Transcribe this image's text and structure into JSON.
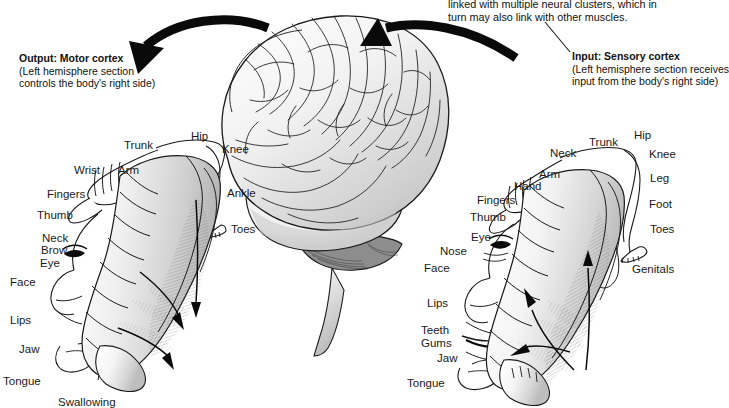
{
  "figure": {
    "background_color": "#ffffff",
    "ink_color": "#1a1a1a"
  },
  "top_note": {
    "name": "neural-cluster-note",
    "lines": [
      "linked with multiple neural clusters, which in",
      "turn may also link with other muscles."
    ]
  },
  "captions": {
    "output": {
      "heading": "Output: Motor cortex",
      "lines": [
        "(Left hemisphere section",
        "controls the body's right side)"
      ]
    },
    "input": {
      "heading": "Input: Sensory cortex",
      "lines": [
        "(Left hemisphere section receives",
        "input from the body's right side)"
      ]
    }
  },
  "brain": {
    "name": "brain-illustration",
    "description": "Lateral view of a human brain with cerebellum and brainstem"
  },
  "arrows": {
    "output_arrow": "curved-arrow-pointing-left",
    "input_arrow": "curved-arrow-pointing-left-into-brain",
    "input_leader": "leader-line"
  },
  "motor_homunculus": {
    "name": "motor-cortex-homunculus",
    "labels": [
      {
        "text": "Trunk",
        "x": 124,
        "y": 139,
        "align": "left"
      },
      {
        "text": "Hip",
        "x": 191,
        "y": 130,
        "align": "left"
      },
      {
        "text": "Knee",
        "x": 222,
        "y": 143,
        "align": "left"
      },
      {
        "text": "Wrist",
        "x": 74,
        "y": 164,
        "align": "left"
      },
      {
        "text": "Arm",
        "x": 118,
        "y": 164,
        "align": "left"
      },
      {
        "text": "Ankle",
        "x": 227,
        "y": 187,
        "align": "left"
      },
      {
        "text": "Fingers",
        "x": 47,
        "y": 188,
        "align": "left"
      },
      {
        "text": "Thumb",
        "x": 37,
        "y": 209,
        "align": "left"
      },
      {
        "text": "Toes",
        "x": 231,
        "y": 223,
        "align": "left"
      },
      {
        "text": "Neck",
        "x": 42,
        "y": 232,
        "align": "left"
      },
      {
        "text": "Brow",
        "x": 41,
        "y": 244,
        "align": "left"
      },
      {
        "text": "Eye",
        "x": 40,
        "y": 257,
        "align": "left"
      },
      {
        "text": "Face",
        "x": 10,
        "y": 276,
        "align": "left"
      },
      {
        "text": "Lips",
        "x": 10,
        "y": 314,
        "align": "left"
      },
      {
        "text": "Jaw",
        "x": 19,
        "y": 343,
        "align": "left"
      },
      {
        "text": "Tongue",
        "x": 3,
        "y": 375,
        "align": "left"
      },
      {
        "text": "Swallowing",
        "x": 58,
        "y": 396,
        "align": "left"
      }
    ]
  },
  "sensory_homunculus": {
    "name": "sensory-cortex-homunculus",
    "labels": [
      {
        "text": "Neck",
        "x": 550,
        "y": 147,
        "align": "left"
      },
      {
        "text": "Trunk",
        "x": 589,
        "y": 136,
        "align": "left"
      },
      {
        "text": "Hip",
        "x": 634,
        "y": 129,
        "align": "left"
      },
      {
        "text": "Knee",
        "x": 649,
        "y": 148,
        "align": "left"
      },
      {
        "text": "Arm",
        "x": 539,
        "y": 168,
        "align": "left"
      },
      {
        "text": "Leg",
        "x": 650,
        "y": 172,
        "align": "left"
      },
      {
        "text": "Hand",
        "x": 514,
        "y": 180,
        "align": "left"
      },
      {
        "text": "Fingers",
        "x": 477,
        "y": 194,
        "align": "left"
      },
      {
        "text": "Foot",
        "x": 649,
        "y": 198,
        "align": "left"
      },
      {
        "text": "Thumb",
        "x": 470,
        "y": 211,
        "align": "left"
      },
      {
        "text": "Toes",
        "x": 650,
        "y": 223,
        "align": "left"
      },
      {
        "text": "Eye",
        "x": 471,
        "y": 231,
        "align": "left"
      },
      {
        "text": "Nose",
        "x": 440,
        "y": 245,
        "align": "left"
      },
      {
        "text": "Face",
        "x": 424,
        "y": 262,
        "align": "left"
      },
      {
        "text": "Genitals",
        "x": 632,
        "y": 263,
        "align": "left"
      },
      {
        "text": "Lips",
        "x": 427,
        "y": 297,
        "align": "left"
      },
      {
        "text": "Teeth",
        "x": 421,
        "y": 324,
        "align": "left"
      },
      {
        "text": "Gums",
        "x": 421,
        "y": 337,
        "align": "left"
      },
      {
        "text": "Jaw",
        "x": 437,
        "y": 352,
        "align": "left"
      },
      {
        "text": "Tongue",
        "x": 407,
        "y": 377,
        "align": "left"
      }
    ]
  }
}
